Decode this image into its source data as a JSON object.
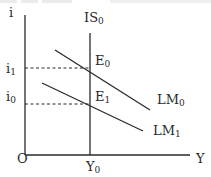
{
  "diagram": {
    "type": "IS-LM diagram",
    "axes": {
      "y_label": "i",
      "x_label": "Y",
      "origin_label": "O"
    },
    "curves": {
      "is": {
        "label": "IS",
        "sub": "0"
      },
      "lm0": {
        "label": "LM",
        "sub": "0"
      },
      "lm1": {
        "label": "LM",
        "sub": "1"
      }
    },
    "points": {
      "e0": {
        "label": "E",
        "sub": "0"
      },
      "e1": {
        "label": "E",
        "sub": "1"
      }
    },
    "y_ticks": {
      "i1": {
        "label": "i",
        "sub": "1"
      },
      "i0": {
        "label": "i",
        "sub": "0"
      }
    },
    "x_ticks": {
      "y0": {
        "label": "Y",
        "sub": "0"
      }
    },
    "colors": {
      "line": "#2a2a2a",
      "background": "#ffffff"
    }
  }
}
